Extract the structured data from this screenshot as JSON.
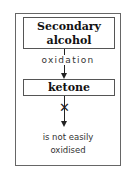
{
  "diagram": {
    "start_box": {
      "line1": "Secondary",
      "line2": "alcohol"
    },
    "arrow_label": "oxidation",
    "result_box": {
      "label": "ketone"
    },
    "blocked_marker": "✕",
    "note": {
      "line1": "is not easily",
      "line2": "oxidised"
    }
  }
}
